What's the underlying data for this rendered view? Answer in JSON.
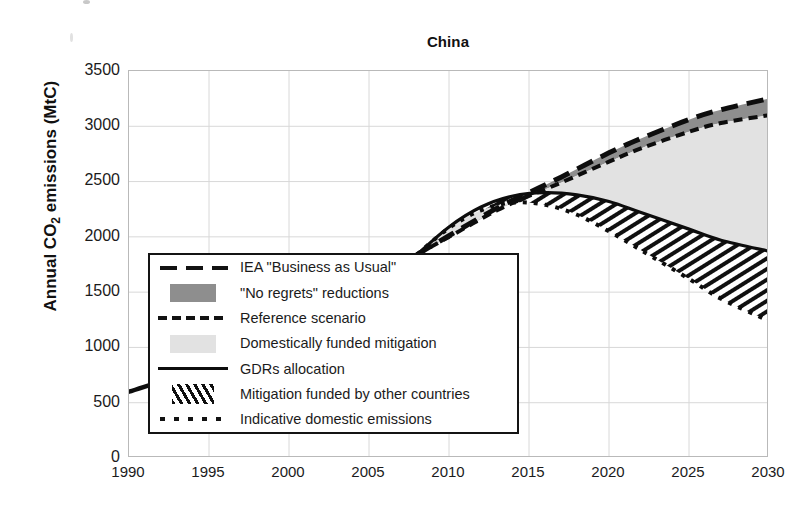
{
  "chart_data": {
    "type": "area",
    "title": "China",
    "xlabel": "",
    "ylabel": "Annual CO2 emissions (MtC)",
    "ylabel_main": "Annual CO",
    "ylabel_sub": "2",
    "ylabel_tail": " emissions (MtC)",
    "xlim": [
      1990,
      2030
    ],
    "ylim": [
      0,
      3500
    ],
    "grid": true,
    "legend_position": "inner-lower-left",
    "xticks": [
      1990,
      1995,
      2000,
      2005,
      2010,
      2015,
      2020,
      2025,
      2030
    ],
    "yticks": [
      0,
      500,
      1000,
      1500,
      2000,
      2500,
      3000,
      3500
    ],
    "series": [
      {
        "name": "Historical / common trajectory",
        "style": "solid-thick",
        "x": [
          1990,
          1995,
          2000,
          2005,
          2008
        ],
        "values": [
          600,
          820,
          960,
          1480,
          1840
        ]
      },
      {
        "name": "IEA \"Business as Usual\"",
        "style": "dashed-long",
        "x": [
          2008,
          2010,
          2013,
          2015,
          2017,
          2020,
          2022,
          2025,
          2027,
          2030
        ],
        "values": [
          1840,
          2010,
          2260,
          2400,
          2540,
          2760,
          2890,
          3060,
          3150,
          3250
        ]
      },
      {
        "name": "Reference scenario",
        "style": "dashed-medium",
        "x": [
          2008,
          2010,
          2013,
          2015,
          2017,
          2020,
          2022,
          2025,
          2027,
          2030
        ],
        "values": [
          1840,
          2000,
          2240,
          2370,
          2490,
          2680,
          2800,
          2950,
          3030,
          3100
        ]
      },
      {
        "name": "GDRs allocation",
        "style": "solid",
        "x": [
          2008,
          2010,
          2012,
          2014,
          2016,
          2018,
          2020,
          2022,
          2025,
          2027,
          2030
        ],
        "values": [
          1840,
          2090,
          2270,
          2370,
          2400,
          2380,
          2320,
          2220,
          2070,
          1970,
          1870
        ]
      },
      {
        "name": "Indicative domestic emissions",
        "style": "dotted",
        "x": [
          2008,
          2010,
          2012,
          2014,
          2016,
          2018,
          2020,
          2022,
          2025,
          2027,
          2030
        ],
        "values": [
          1840,
          2080,
          2240,
          2310,
          2290,
          2200,
          2050,
          1880,
          1620,
          1440,
          1240
        ]
      }
    ],
    "bands": [
      {
        "name": "\"No regrets\" reductions",
        "fill": "dark-grey",
        "color": "#8e8e8e",
        "upper_series": "IEA \"Business as Usual\"",
        "lower_series": "Reference scenario"
      },
      {
        "name": "Domestically funded mitigation",
        "fill": "light-grey",
        "color": "#e2e2e2",
        "upper_series": "Reference scenario",
        "lower_series": "GDRs allocation"
      },
      {
        "name": "Mitigation funded by other countries",
        "fill": "diagonal-hatch",
        "color": "#0f0f0f",
        "upper_series": "GDRs allocation",
        "lower_series": "Indicative domestic emissions"
      }
    ]
  },
  "legend": {
    "items": [
      {
        "label": "IEA \"Business as Usual\"",
        "key": "dashed-long-key"
      },
      {
        "label": "\"No regrets\" reductions",
        "key": "dark-grey-swatch"
      },
      {
        "label": "Reference scenario",
        "key": "dashed-medium-key"
      },
      {
        "label": "Domestically funded mitigation",
        "key": "light-grey-swatch"
      },
      {
        "label": "GDRs allocation",
        "key": "solid-line-key"
      },
      {
        "label": "Mitigation funded by other countries",
        "key": "hatch-swatch"
      },
      {
        "label": "Indicative domestic emissions",
        "key": "dotted-line-key"
      }
    ]
  },
  "colors": {
    "no_regrets": "#8e8e8e",
    "domestic_mitigation": "#e2e2e2",
    "line": "#0d0d0d",
    "grid": "#d8d8d8",
    "axis": "#b9b9b9"
  }
}
